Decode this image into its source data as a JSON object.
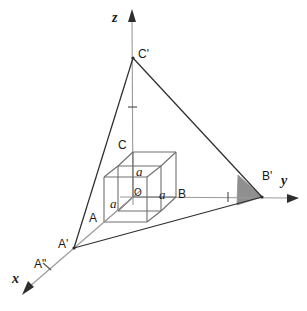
{
  "figure": {
    "background_color": "#ffffff",
    "stroke_color": "#3a3a3a",
    "light_stroke_color": "#8c8c8c",
    "shade_fill_color": "#8f8f8f",
    "width": 307,
    "height": 311
  },
  "axes": {
    "x": {
      "label": "x",
      "tip": [
        24,
        292
      ],
      "origin": [
        133,
        197
      ]
    },
    "y": {
      "label": "y",
      "tip": [
        297,
        198
      ],
      "origin": [
        133,
        197
      ]
    },
    "z": {
      "label": "z",
      "tip": [
        132,
        11
      ],
      "origin": [
        133,
        197
      ]
    }
  },
  "points": {
    "O": {
      "label": "O",
      "x": 133,
      "y": 197
    },
    "A": {
      "label": "A",
      "x": 104,
      "y": 222
    },
    "B": {
      "label": "B",
      "x": 176,
      "y": 197
    },
    "C": {
      "label": "C",
      "x": 133,
      "y": 152
    },
    "A_prime": {
      "label": "A'",
      "x": 74,
      "y": 248
    },
    "A_double_prime": {
      "label": "A\"",
      "x": 50,
      "y": 270
    },
    "B_prime": {
      "label": "B'",
      "x": 262,
      "y": 197
    },
    "C_prime": {
      "label": "C'",
      "x": 133,
      "y": 58
    }
  },
  "edge_labels": {
    "a_vertical": "a",
    "a_horizontal": "a",
    "a_depth": "a"
  },
  "ticks": {
    "z_tick_y": 107,
    "y_tick_x": 228,
    "x_tick": [
      47,
      267
    ]
  },
  "shaded_region": {
    "name": "shaded-triangle",
    "fill": "#8f8f8f",
    "points": "238,175 262,197 237,205"
  }
}
